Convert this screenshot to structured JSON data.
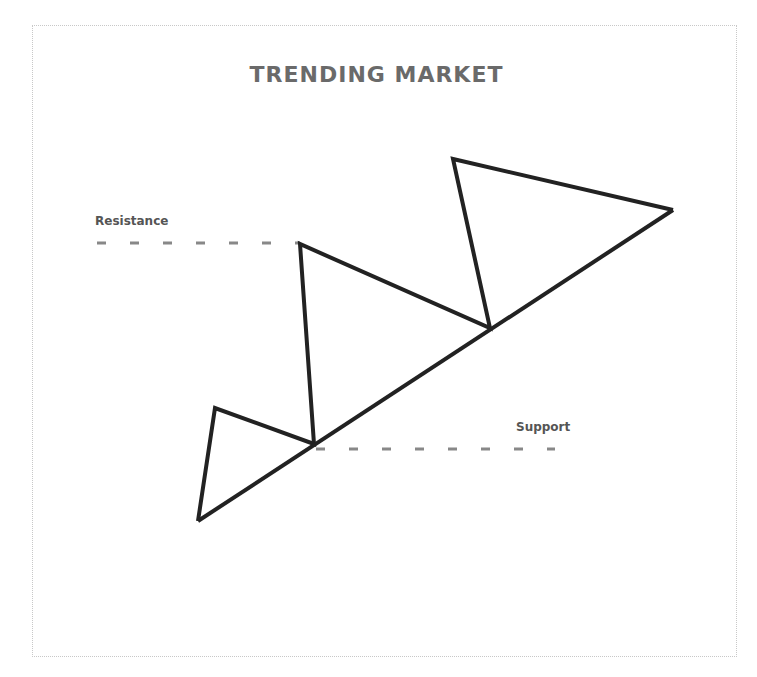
{
  "diagram": {
    "title": "TRENDING MARKET",
    "labels": {
      "resistance": "Resistance",
      "support": "Support"
    },
    "colors": {
      "line": "#222222",
      "dash": "#888888",
      "title": "#6a6a6a",
      "frame": "#c8c8c8"
    },
    "price_path": [
      [
        198,
        521
      ],
      [
        215,
        408
      ],
      [
        314,
        444
      ],
      [
        300,
        244
      ],
      [
        490,
        328
      ],
      [
        453,
        159
      ],
      [
        673,
        210
      ]
    ],
    "trend_line": [
      [
        198,
        521
      ],
      [
        673,
        210
      ]
    ],
    "resistance_line": {
      "y": 243,
      "x_start": 97,
      "x_end": 300
    },
    "support_line": {
      "y": 449,
      "x_start": 316,
      "x_end": 555
    }
  }
}
